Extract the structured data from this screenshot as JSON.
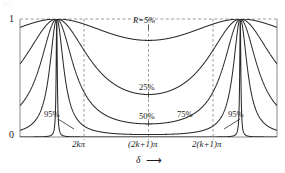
{
  "figure": {
    "kind": "fabry-perot-transmission-fringes",
    "ghost_caption": "(a)"
  },
  "axes": {
    "y_top_label": "1",
    "y_bottom_label": "0",
    "x_title": "δ",
    "x_arrow": "⟶",
    "x_ticks": [
      {
        "label": "2kπ"
      },
      {
        "label": "(2k+1)π"
      },
      {
        "label": "2(k+1)π"
      }
    ]
  },
  "curve_labels": [
    {
      "id": "r5",
      "text": "R=5%"
    },
    {
      "id": "r25",
      "text": "25%"
    },
    {
      "id": "r50",
      "text": "50%"
    },
    {
      "id": "r75",
      "text": "75%"
    },
    {
      "id": "r95l",
      "text": "95%"
    },
    {
      "id": "r95r",
      "text": "95%"
    }
  ],
  "colors": {
    "curve": "#2b2b2b",
    "frame": "#8a8a8a",
    "dashed": "#9a9a9a",
    "text": "#1a1a1a",
    "background": "#ffffff"
  },
  "chart_data": {
    "type": "line",
    "title": "",
    "xlabel": "δ",
    "ylabel": "",
    "grid": false,
    "legend": "inline-annotations",
    "xlim": [
      -1.2566,
      7.5398
    ],
    "ylim": [
      0,
      1
    ],
    "x_tick_values": [
      0,
      3.1416,
      6.2832
    ],
    "x_tick_labels": [
      "2kπ",
      "(2k+1)π",
      "2(k+1)π"
    ],
    "y_tick_values": [
      0,
      1
    ],
    "y_tick_labels": [
      "0",
      "1"
    ],
    "function": "Airy transmittance  T(delta) = 1 / (1 + F*sin^2(delta/2)),  F = 4R/(1-R)^2",
    "series": [
      {
        "name": "R=5%",
        "R": 0.05,
        "finesse_F": 0.2216,
        "min_value": 0.8186,
        "peak_value": 1.0
      },
      {
        "name": "25%",
        "R": 0.25,
        "finesse_F": 1.7778,
        "min_value": 0.36,
        "peak_value": 1.0
      },
      {
        "name": "50%",
        "R": 0.5,
        "finesse_F": 8.0,
        "min_value": 0.1111,
        "peak_value": 1.0
      },
      {
        "name": "75%",
        "R": 0.75,
        "finesse_F": 48.0,
        "min_value": 0.0204,
        "peak_value": 1.0
      },
      {
        "name": "95%",
        "R": 0.95,
        "finesse_F": 7600.0,
        "min_value": 0.0001,
        "peak_value": 1.0
      }
    ],
    "annotations": [
      {
        "text": "R=5%",
        "x": 3.1416,
        "y": 0.92
      },
      {
        "text": "25%",
        "x": 3.1416,
        "y": 0.5
      },
      {
        "text": "50%",
        "x": 3.1416,
        "y": 0.24
      },
      {
        "text": "75%",
        "x": 4.05,
        "y": 0.24
      },
      {
        "text": "95%",
        "x": -0.62,
        "y": 0.24
      },
      {
        "text": "95%",
        "x": 4.86,
        "y": 0.24
      }
    ]
  }
}
